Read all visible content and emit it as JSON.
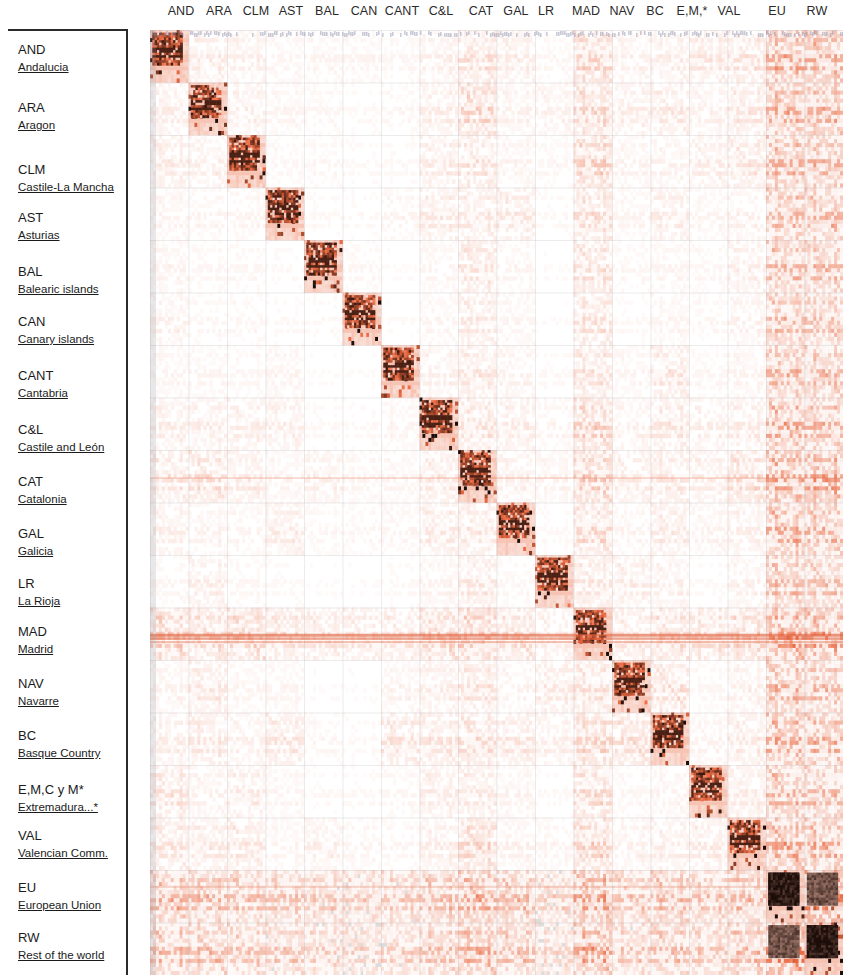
{
  "figure": {
    "type": "heatmap"
  },
  "columns": {
    "labels": [
      "AND",
      "ARA",
      "CLM",
      "AST",
      "BAL",
      "CAN",
      "CANT",
      "C&L",
      "CAT",
      "GAL",
      "LR",
      "MAD",
      "NAV",
      "BC",
      "E,M,*",
      "VAL",
      "EU",
      "RW"
    ]
  },
  "rows": [
    {
      "code": "AND",
      "name": "Andalucia"
    },
    {
      "code": "ARA",
      "name": "Aragon"
    },
    {
      "code": "CLM",
      "name": "Castile-La Mancha"
    },
    {
      "code": "AST",
      "name": "Asturias"
    },
    {
      "code": "BAL",
      "name": "Balearic islands"
    },
    {
      "code": "CAN",
      "name": "Canary islands"
    },
    {
      "code": "CANT",
      "name": "Cantabria"
    },
    {
      "code": "C&L",
      "name": "Castile and León"
    },
    {
      "code": "CAT",
      "name": "Catalonia"
    },
    {
      "code": "GAL",
      "name": "Galicia"
    },
    {
      "code": "LR",
      "name": "La Rioja"
    },
    {
      "code": "MAD",
      "name": "Madrid"
    },
    {
      "code": "NAV",
      "name": "Navarre"
    },
    {
      "code": "BC",
      "name": "Basque Country"
    },
    {
      "code": "E,M,C y M*",
      "name": "Extremadura...*"
    },
    {
      "code": "VAL",
      "name": "Valencian Comm."
    },
    {
      "code": "EU",
      "name": "European Union"
    },
    {
      "code": "RW",
      "name": "Rest of the world"
    }
  ],
  "chart_data": {
    "type": "heatmap",
    "title": "",
    "xlabel": "",
    "ylabel": "",
    "grid": true,
    "legend_position": "none",
    "colorscale": {
      "low": "#ffffff",
      "mid": "#e8673c",
      "high": "#1a0a06",
      "shaded_block": "#b8b8b8"
    },
    "categories": [
      "AND",
      "ARA",
      "CLM",
      "AST",
      "BAL",
      "CAN",
      "CANT",
      "C&L",
      "CAT",
      "GAL",
      "LR",
      "MAD",
      "NAV",
      "BC",
      "E,M,*",
      "VAL",
      "EU",
      "RW"
    ],
    "note": "Values are intensity of intermediate flows; diagonal blocks (intra-regional) are strongest, EU and RW row/column bands are shaded grey, EU-EU and RW-RW blocks are near black.",
    "block_intensity_matrix": [
      [
        0.95,
        0.1,
        0.08,
        0.05,
        0.05,
        0.05,
        0.04,
        0.08,
        0.16,
        0.09,
        0.04,
        0.22,
        0.07,
        0.09,
        0.12,
        0.14,
        0.42,
        0.4
      ],
      [
        0.09,
        0.92,
        0.08,
        0.05,
        0.04,
        0.03,
        0.04,
        0.09,
        0.22,
        0.07,
        0.07,
        0.2,
        0.09,
        0.11,
        0.07,
        0.12,
        0.4,
        0.38
      ],
      [
        0.1,
        0.08,
        0.9,
        0.04,
        0.04,
        0.03,
        0.03,
        0.1,
        0.14,
        0.06,
        0.04,
        0.24,
        0.06,
        0.07,
        0.09,
        0.13,
        0.38,
        0.36
      ],
      [
        0.06,
        0.05,
        0.05,
        0.88,
        0.03,
        0.03,
        0.05,
        0.11,
        0.11,
        0.12,
        0.03,
        0.17,
        0.05,
        0.1,
        0.05,
        0.07,
        0.36,
        0.34
      ],
      [
        0.06,
        0.04,
        0.04,
        0.03,
        0.86,
        0.04,
        0.02,
        0.05,
        0.14,
        0.05,
        0.02,
        0.16,
        0.04,
        0.05,
        0.04,
        0.09,
        0.34,
        0.32
      ],
      [
        0.07,
        0.04,
        0.04,
        0.03,
        0.03,
        0.85,
        0.02,
        0.05,
        0.11,
        0.05,
        0.02,
        0.15,
        0.03,
        0.05,
        0.04,
        0.07,
        0.33,
        0.31
      ],
      [
        0.05,
        0.05,
        0.04,
        0.06,
        0.02,
        0.02,
        0.84,
        0.08,
        0.12,
        0.07,
        0.03,
        0.15,
        0.05,
        0.13,
        0.04,
        0.06,
        0.35,
        0.32
      ],
      [
        0.09,
        0.09,
        0.09,
        0.09,
        0.03,
        0.03,
        0.05,
        0.92,
        0.15,
        0.1,
        0.05,
        0.23,
        0.07,
        0.12,
        0.08,
        0.1,
        0.4,
        0.36
      ],
      [
        0.13,
        0.16,
        0.1,
        0.06,
        0.08,
        0.05,
        0.05,
        0.11,
        0.95,
        0.08,
        0.06,
        0.26,
        0.1,
        0.12,
        0.09,
        0.18,
        0.46,
        0.44
      ],
      [
        0.08,
        0.06,
        0.05,
        0.1,
        0.04,
        0.04,
        0.05,
        0.11,
        0.12,
        0.9,
        0.03,
        0.19,
        0.05,
        0.11,
        0.06,
        0.08,
        0.4,
        0.37
      ],
      [
        0.04,
        0.09,
        0.04,
        0.03,
        0.02,
        0.02,
        0.03,
        0.06,
        0.12,
        0.04,
        0.82,
        0.13,
        0.1,
        0.08,
        0.03,
        0.07,
        0.32,
        0.29
      ],
      [
        0.24,
        0.19,
        0.22,
        0.15,
        0.12,
        0.12,
        0.12,
        0.22,
        0.27,
        0.18,
        0.09,
        0.95,
        0.12,
        0.18,
        0.17,
        0.22,
        0.5,
        0.46
      ],
      [
        0.06,
        0.11,
        0.05,
        0.05,
        0.02,
        0.02,
        0.06,
        0.09,
        0.14,
        0.06,
        0.11,
        0.16,
        0.86,
        0.16,
        0.04,
        0.08,
        0.36,
        0.33
      ],
      [
        0.09,
        0.12,
        0.07,
        0.12,
        0.04,
        0.03,
        0.14,
        0.13,
        0.17,
        0.12,
        0.08,
        0.21,
        0.16,
        0.93,
        0.06,
        0.11,
        0.42,
        0.39
      ],
      [
        0.14,
        0.07,
        0.1,
        0.05,
        0.03,
        0.03,
        0.04,
        0.1,
        0.11,
        0.06,
        0.03,
        0.19,
        0.04,
        0.06,
        0.88,
        0.1,
        0.36,
        0.33
      ],
      [
        0.13,
        0.11,
        0.12,
        0.05,
        0.08,
        0.05,
        0.04,
        0.09,
        0.2,
        0.07,
        0.05,
        0.22,
        0.07,
        0.09,
        0.1,
        0.92,
        0.42,
        0.39
      ],
      [
        0.35,
        0.33,
        0.3,
        0.28,
        0.25,
        0.24,
        0.26,
        0.32,
        0.4,
        0.32,
        0.22,
        0.46,
        0.28,
        0.34,
        0.29,
        0.35,
        0.99,
        0.62
      ],
      [
        0.33,
        0.31,
        0.28,
        0.26,
        0.23,
        0.22,
        0.24,
        0.3,
        0.38,
        0.3,
        0.2,
        0.44,
        0.26,
        0.32,
        0.27,
        0.33,
        0.62,
        0.99
      ]
    ]
  }
}
